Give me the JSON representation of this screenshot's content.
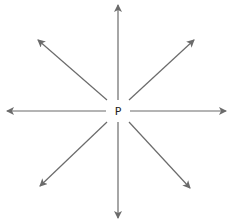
{
  "diagram": {
    "center_label": "P",
    "center": {
      "x": 118,
      "y": 111
    },
    "arrow_color": "#6b6b6b",
    "arrows": [
      {
        "direction": "up",
        "x1": 118,
        "y1": 100,
        "x2": 118,
        "y2": 5
      },
      {
        "direction": "down",
        "x1": 118,
        "y1": 122,
        "x2": 118,
        "y2": 218
      },
      {
        "direction": "left",
        "x1": 106,
        "y1": 111,
        "x2": 7,
        "y2": 111
      },
      {
        "direction": "right",
        "x1": 130,
        "y1": 111,
        "x2": 226,
        "y2": 111
      },
      {
        "direction": "up-left",
        "x1": 107,
        "y1": 100,
        "x2": 38,
        "y2": 40
      },
      {
        "direction": "up-right",
        "x1": 129,
        "y1": 100,
        "x2": 194,
        "y2": 40
      },
      {
        "direction": "down-left",
        "x1": 107,
        "y1": 122,
        "x2": 40,
        "y2": 186
      },
      {
        "direction": "down-right",
        "x1": 129,
        "y1": 122,
        "x2": 190,
        "y2": 188
      }
    ]
  }
}
